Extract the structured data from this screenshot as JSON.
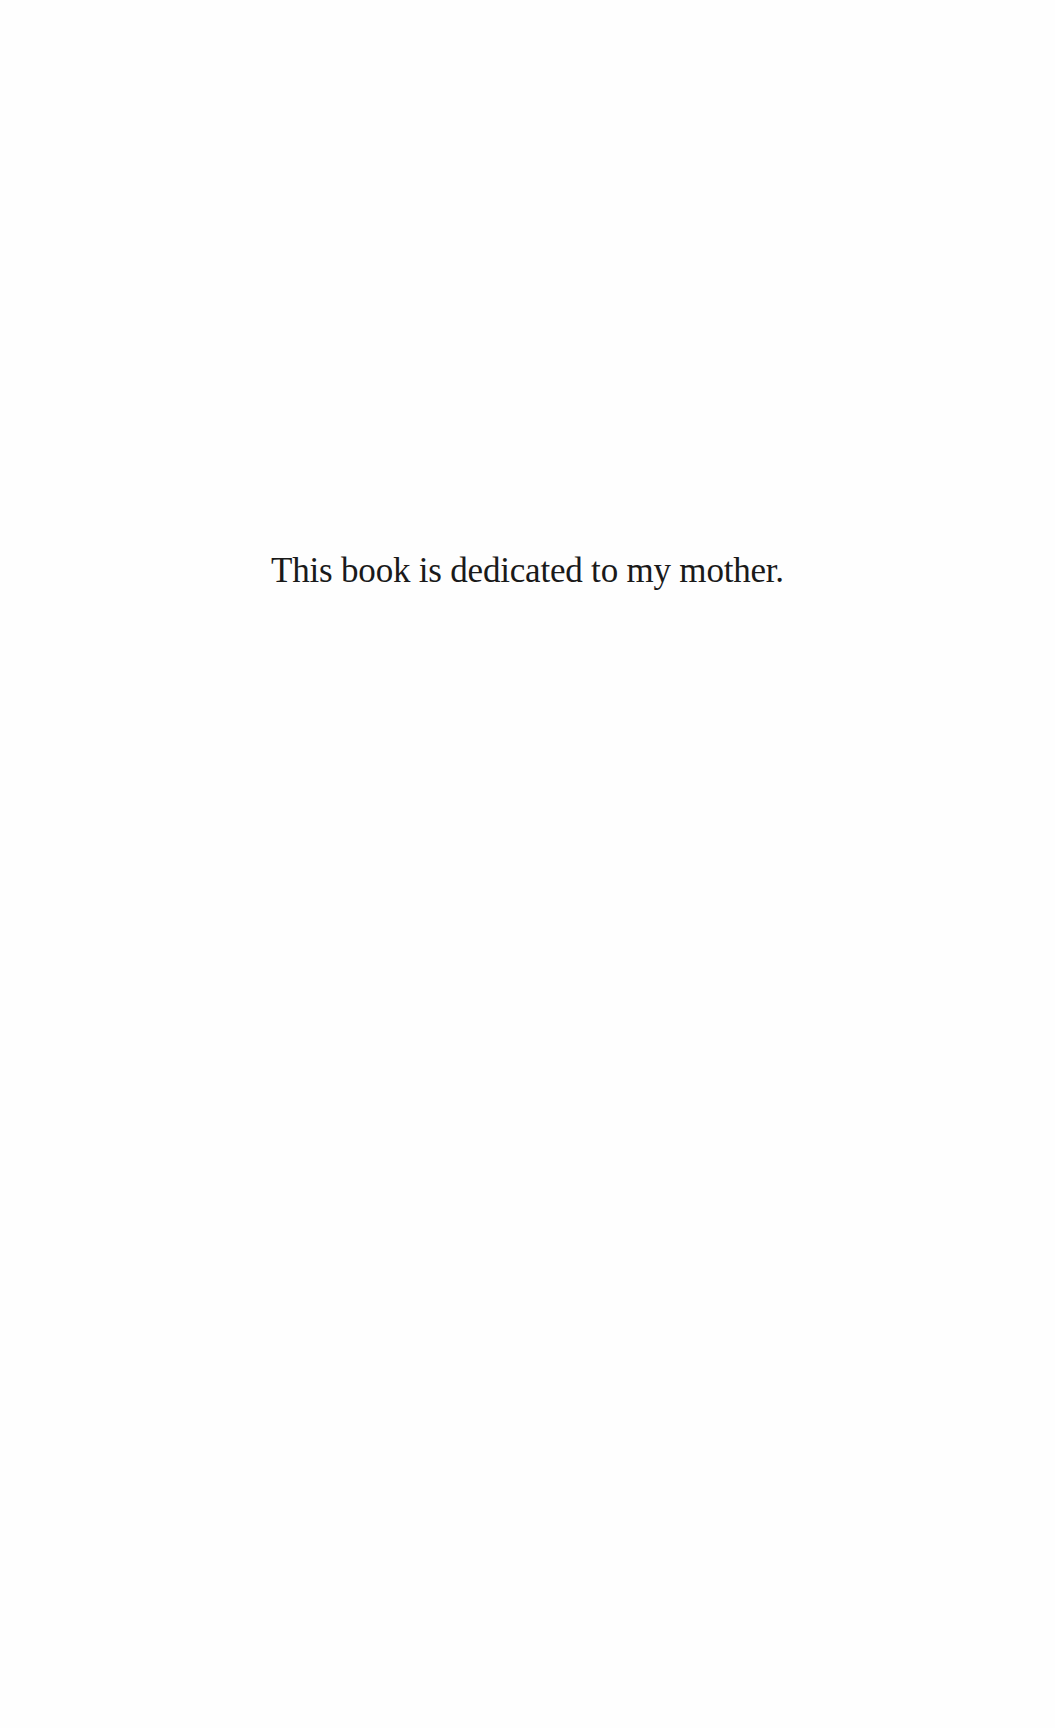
{
  "page": {
    "dedication": "This book is dedicated to my mother."
  }
}
